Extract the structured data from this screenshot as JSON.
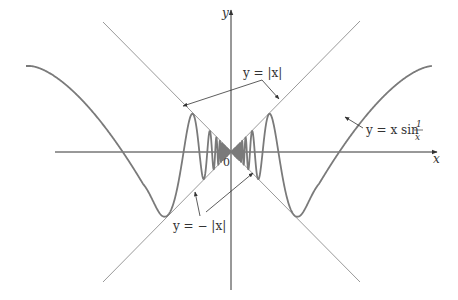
{
  "figure": {
    "origin_label": "0",
    "x_axis_label": "x",
    "y_axis_label": "y",
    "labels": {
      "upper_envelope": "y = |x|",
      "lower_envelope": "y = − |x|",
      "curve_prefix": "y = x sin",
      "curve_frac_num": "1",
      "curve_frac_den": "x"
    },
    "colors": {
      "curve": "#7a7a7a",
      "axes": "#333333",
      "envelope": "#9a9a9a",
      "text": "#333333"
    }
  },
  "geometry": {
    "origin": [
      231,
      152
    ],
    "x_axis": [
      55,
      437
    ],
    "y_axis": [
      290,
      10
    ],
    "envelope_half_extent": 129,
    "scale_px_per_unit": 298,
    "curve_x_range_px": [
      -205,
      201
    ]
  }
}
